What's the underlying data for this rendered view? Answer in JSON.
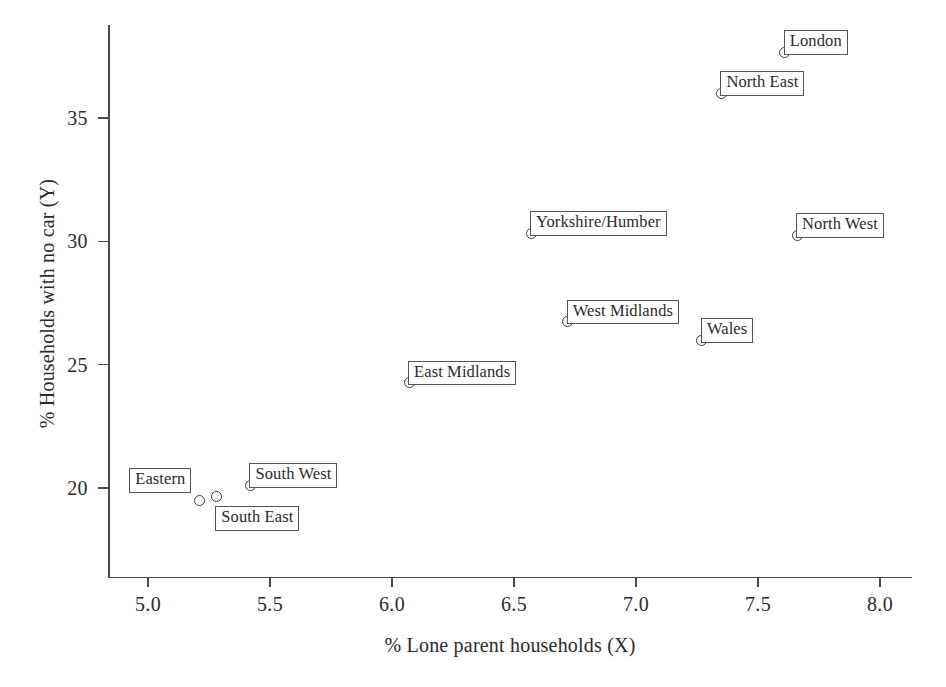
{
  "chart_data": {
    "type": "scatter",
    "title": "",
    "xlabel": "% Lone parent households (X)",
    "ylabel": "% Households with no car (Y)",
    "xlim": [
      4.78,
      8.13
    ],
    "ylim": [
      18.3,
      38.5
    ],
    "xticks": [
      "5.0",
      "5.5",
      "6.0",
      "6.5",
      "7.0",
      "7.5",
      "8.0"
    ],
    "xtick_values": [
      5.0,
      5.5,
      6.0,
      6.5,
      7.0,
      7.5,
      8.0
    ],
    "yticks": [
      "20",
      "25",
      "30",
      "35"
    ],
    "ytick_values": [
      20,
      25,
      30,
      35
    ],
    "grid": false,
    "legend": null,
    "marker": "open-circle",
    "point_color": "#3d3d3d",
    "axis_color": "#4a4a4a",
    "points": [
      {
        "label": "London",
        "x": 7.61,
        "y": 37.67,
        "label_pos": "top-right"
      },
      {
        "label": "North East",
        "x": 7.35,
        "y": 36.0,
        "label_pos": "top-right"
      },
      {
        "label": "North West",
        "x": 7.66,
        "y": 30.24,
        "label_pos": "top-right"
      },
      {
        "label": "Yorkshire/Humber",
        "x": 6.57,
        "y": 30.33,
        "label_pos": "top-right"
      },
      {
        "label": "West Midlands",
        "x": 6.72,
        "y": 26.74,
        "label_pos": "top-right"
      },
      {
        "label": "Wales",
        "x": 7.27,
        "y": 25.98,
        "label_pos": "top-right"
      },
      {
        "label": "East Midlands",
        "x": 6.07,
        "y": 24.27,
        "label_pos": "top-right"
      },
      {
        "label": "South West",
        "x": 5.42,
        "y": 20.12,
        "label_pos": "top-right"
      },
      {
        "label": "South East",
        "x": 5.28,
        "y": 19.67,
        "label_pos": "bottom-right"
      },
      {
        "label": "Eastern",
        "x": 5.21,
        "y": 19.51,
        "label_pos": "top-left"
      }
    ]
  }
}
